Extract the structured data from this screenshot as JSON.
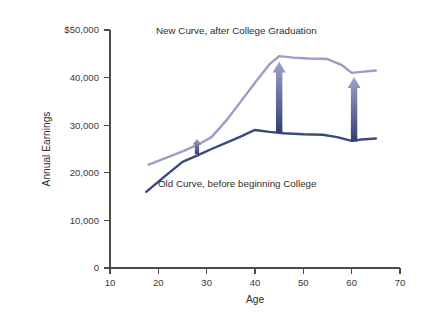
{
  "chart_data": {
    "type": "line",
    "title": "",
    "xlabel": "Age",
    "ylabel": "Annual Earnings",
    "xlim": [
      10,
      70
    ],
    "ylim": [
      0,
      50000
    ],
    "grid": false,
    "legend_position": "inline-annotations",
    "x_ticks": [
      "10",
      "20",
      "30",
      "40",
      "50",
      "60",
      "70"
    ],
    "x_tick_values": [
      10,
      20,
      30,
      40,
      50,
      60,
      70
    ],
    "y_ticks": [
      "0",
      "10,000",
      "20,000",
      "30,000",
      "40,000",
      "$50,000"
    ],
    "y_tick_values": [
      0,
      10000,
      20000,
      30000,
      40000,
      50000
    ],
    "series": [
      {
        "name": "New Curve, after College Graduation",
        "color": "#9a9ec8",
        "x": [
          18,
          22,
          25,
          28,
          31,
          34,
          37,
          40,
          43,
          45,
          48,
          51,
          55,
          58,
          60,
          62,
          65
        ],
        "values": [
          21700,
          23300,
          24500,
          25800,
          27500,
          30900,
          34900,
          38900,
          42800,
          44500,
          44200,
          44000,
          43900,
          42600,
          41000,
          41200,
          41500
        ]
      },
      {
        "name": "Old Curve, before beginning College",
        "color": "#3b4a7a",
        "x": [
          17.5,
          21,
          25,
          28,
          31,
          34,
          37,
          40,
          43,
          46,
          50,
          54,
          57,
          60,
          62,
          65
        ],
        "values": [
          16000,
          19000,
          22300,
          23600,
          25000,
          26300,
          27600,
          29000,
          28600,
          28300,
          28100,
          28000,
          27500,
          26700,
          27000,
          27200
        ]
      }
    ],
    "annotations": [
      {
        "id": "new-curve-label",
        "text": "New Curve, after College Graduation",
        "x": 38,
        "y": 48200
      },
      {
        "id": "old-curve-label",
        "text": "Old Curve, before beginning College",
        "x": 31,
        "y": 20600
      }
    ],
    "arrows": [
      {
        "id": "gap-arrow-age-28",
        "x": 28,
        "y_bottom": 23900,
        "y_top": 27100,
        "label": "earnings gap at age 28"
      },
      {
        "id": "gap-arrow-age-45",
        "x": 45,
        "y_bottom": 28400,
        "y_top": 43400,
        "label": "earnings gap at age 45"
      },
      {
        "id": "gap-arrow-age-60",
        "x": 60.5,
        "y_bottom": 26600,
        "y_top": 40100,
        "label": "earnings gap at age 60"
      }
    ],
    "arrow_gradient": {
      "top": "#a0a3cc",
      "bottom": "#2f3f72"
    },
    "axis_color": "#4a4a4a",
    "background": "#ffffff"
  }
}
